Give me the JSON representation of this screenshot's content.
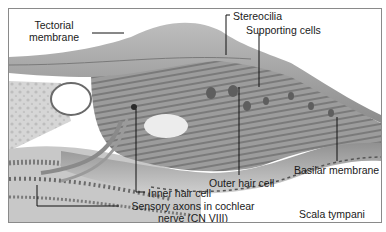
{
  "diagram": {
    "type": "anatomical-illustration",
    "colors": {
      "frame_border": "#8a8a8a",
      "tectorial": "#a8a8a8",
      "tissue_dark": "#6f6f6f",
      "tissue_mid": "#9a9a9a",
      "tissue_light": "#cfcfcf",
      "background": "#ffffff",
      "leader_line": "#111111"
    },
    "labels": {
      "tectorial_membrane_line1": "Tectorial",
      "tectorial_membrane_line2": "membrane",
      "stereocilia": "Stereocilia",
      "supporting_cells": "Supporting cells",
      "outer_hair_cell": "Outer hair cell",
      "basilar_membrane": "Basilar membrane",
      "inner_hair_cell": "Inner hair cell",
      "sensory_axons_line1": "Sensory axons in cochlear",
      "sensory_axons_line2": "nerve (CN VIII)",
      "scala_tympani": "Scala tympani"
    }
  }
}
